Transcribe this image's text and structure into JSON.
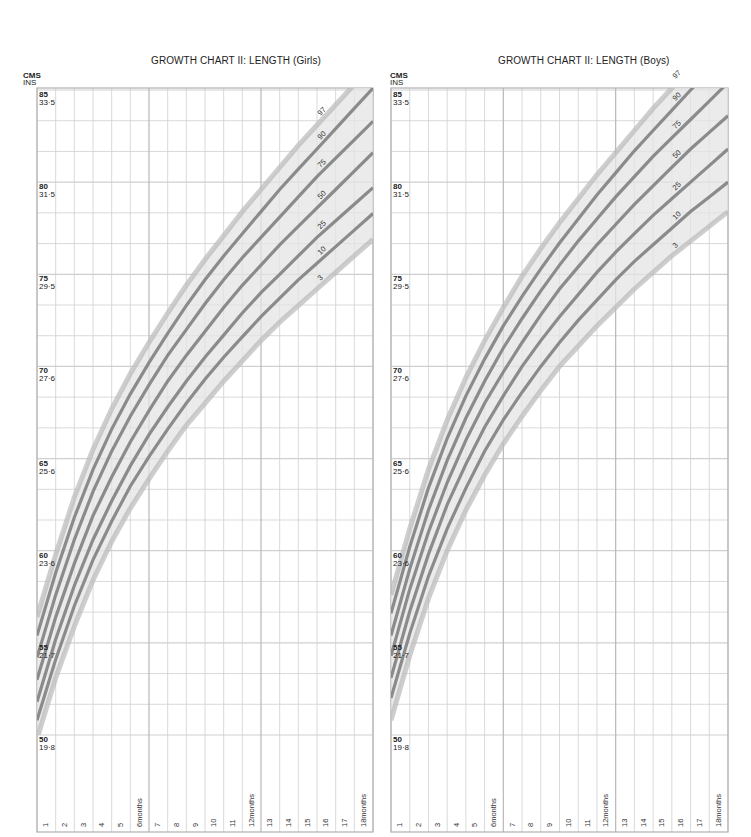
{
  "chart_data": [
    {
      "type": "line",
      "title": "GROWTH CHART II: LENGTH  (Girls)",
      "ylabel_primary": "CMS",
      "ylabel_secondary": "INS",
      "xlabel": "Age (months)",
      "x": [
        1,
        2,
        3,
        4,
        5,
        6,
        7,
        8,
        9,
        10,
        11,
        12,
        13,
        14,
        15,
        16,
        17,
        18
      ],
      "x_tick_labels": [
        "1",
        "2",
        "3",
        "4",
        "5",
        "6months",
        "7",
        "8",
        "9",
        "10",
        "11",
        "12months",
        "13",
        "14",
        "15",
        "16",
        "17",
        "18months"
      ],
      "ylim": [
        50,
        85
      ],
      "y_ticks": [
        {
          "cm": "85",
          "in": "33·5"
        },
        {
          "cm": "80",
          "in": "31·5"
        },
        {
          "cm": "75",
          "in": "29·5"
        },
        {
          "cm": "70",
          "in": "27·6"
        },
        {
          "cm": "65",
          "in": "25·6"
        },
        {
          "cm": "60",
          "in": "23·6"
        },
        {
          "cm": "55",
          "in": "21·7"
        },
        {
          "cm": "50",
          "in": "19·8"
        }
      ],
      "grid": true,
      "series": [
        {
          "name": "97",
          "values": [
            56.4,
            59.8,
            62.9,
            65.5,
            67.7,
            69.6,
            71.3,
            72.9,
            74.4,
            75.8,
            77.1,
            78.4,
            79.6,
            80.8,
            82.0,
            83.1,
            84.2,
            85.3
          ]
        },
        {
          "name": "90",
          "values": [
            55.4,
            58.8,
            61.8,
            64.4,
            66.6,
            68.5,
            70.2,
            71.8,
            73.3,
            74.7,
            76.0,
            77.2,
            78.4,
            79.6,
            80.7,
            81.8,
            82.9,
            84.0
          ]
        },
        {
          "name": "75",
          "values": [
            54.2,
            57.6,
            60.6,
            63.2,
            65.4,
            67.3,
            69.0,
            70.6,
            72.0,
            73.4,
            74.7,
            75.9,
            77.0,
            78.1,
            79.2,
            80.3,
            81.3,
            82.3
          ]
        },
        {
          "name": "50",
          "values": [
            53.0,
            56.4,
            59.3,
            61.9,
            64.0,
            65.9,
            67.6,
            69.2,
            70.6,
            71.9,
            73.2,
            74.4,
            75.5,
            76.6,
            77.6,
            78.6,
            79.6,
            80.6
          ]
        },
        {
          "name": "25",
          "values": [
            51.8,
            55.2,
            58.1,
            60.6,
            62.7,
            64.6,
            66.3,
            67.8,
            69.2,
            70.5,
            71.7,
            72.9,
            74.0,
            75.0,
            76.0,
            77.0,
            77.9,
            78.8
          ]
        },
        {
          "name": "10",
          "values": [
            50.8,
            54.1,
            57.0,
            59.5,
            61.6,
            63.5,
            65.1,
            66.6,
            68.0,
            69.3,
            70.5,
            71.6,
            72.7,
            73.7,
            74.7,
            75.6,
            76.5,
            77.4
          ]
        },
        {
          "name": "3",
          "values": [
            49.8,
            53.1,
            55.9,
            58.4,
            60.5,
            62.3,
            63.9,
            65.4,
            66.8,
            68.0,
            69.2,
            70.3,
            71.4,
            72.4,
            73.3,
            74.2,
            75.1,
            76.0
          ]
        }
      ]
    },
    {
      "type": "line",
      "title": "GROWTH CHART II: LENGTH (Boys)",
      "ylabel_primary": "CMS",
      "ylabel_secondary": "INS",
      "xlabel": "Age (months)",
      "x": [
        1,
        2,
        3,
        4,
        5,
        6,
        7,
        8,
        9,
        10,
        11,
        12,
        13,
        14,
        15,
        16,
        17,
        18
      ],
      "x_tick_labels": [
        "1",
        "2",
        "3",
        "4",
        "5",
        "6months",
        "7",
        "8",
        "9",
        "10",
        "11",
        "12months",
        "13",
        "14",
        "15",
        "16",
        "17",
        "18months"
      ],
      "ylim": [
        50,
        85
      ],
      "y_ticks": [
        {
          "cm": "85",
          "in": "33·5"
        },
        {
          "cm": "80",
          "in": "31·5"
        },
        {
          "cm": "75",
          "in": "29·5"
        },
        {
          "cm": "70",
          "in": "27·6"
        },
        {
          "cm": "65",
          "in": "25·6"
        },
        {
          "cm": "60",
          "in": "23·6"
        },
        {
          "cm": "55",
          "in": "21·7"
        },
        {
          "cm": "50",
          "in": "19·8"
        }
      ],
      "grid": true,
      "series": [
        {
          "name": "97",
          "values": [
            57.6,
            61.2,
            64.4,
            67.1,
            69.4,
            71.4,
            73.2,
            74.9,
            76.4,
            77.8,
            79.1,
            80.4,
            81.6,
            82.8,
            84.0,
            85.1,
            86.2,
            87.3
          ]
        },
        {
          "name": "90",
          "values": [
            56.6,
            60.2,
            63.4,
            66.1,
            68.4,
            70.4,
            72.2,
            73.8,
            75.3,
            76.7,
            78.0,
            79.3,
            80.5,
            81.7,
            82.8,
            83.9,
            85.0,
            86.0
          ]
        },
        {
          "name": "75",
          "values": [
            55.4,
            59.0,
            62.2,
            64.9,
            67.2,
            69.2,
            71.0,
            72.6,
            74.1,
            75.5,
            76.8,
            78.0,
            79.2,
            80.3,
            81.4,
            82.4,
            83.4,
            84.4
          ]
        },
        {
          "name": "50",
          "values": [
            54.3,
            57.9,
            61.0,
            63.7,
            66.0,
            68.0,
            69.7,
            71.3,
            72.8,
            74.2,
            75.4,
            76.6,
            77.7,
            78.8,
            79.8,
            80.8,
            81.8,
            82.7
          ]
        },
        {
          "name": "25",
          "values": [
            53.1,
            56.7,
            59.8,
            62.5,
            64.7,
            66.7,
            68.4,
            70.0,
            71.4,
            72.7,
            73.9,
            75.1,
            76.2,
            77.2,
            78.2,
            79.1,
            80.0,
            80.9
          ]
        },
        {
          "name": "10",
          "values": [
            52.0,
            55.5,
            58.6,
            61.2,
            63.4,
            65.4,
            67.1,
            68.6,
            70.0,
            71.3,
            72.5,
            73.6,
            74.7,
            75.7,
            76.6,
            77.5,
            78.4,
            79.2
          ]
        },
        {
          "name": "3",
          "values": [
            50.8,
            54.3,
            57.4,
            60.0,
            62.2,
            64.1,
            65.8,
            67.3,
            68.7,
            70.0,
            71.1,
            72.2,
            73.2,
            74.2,
            75.1,
            76.0,
            76.8,
            77.6
          ]
        }
      ]
    }
  ],
  "style": {
    "band_fill": "#e4e4e4",
    "band_edge": "#b9b9b9",
    "line_color": "#7a7a7a",
    "grid_color": "#cfcfcf",
    "frame_color": "#b0b0b0"
  }
}
